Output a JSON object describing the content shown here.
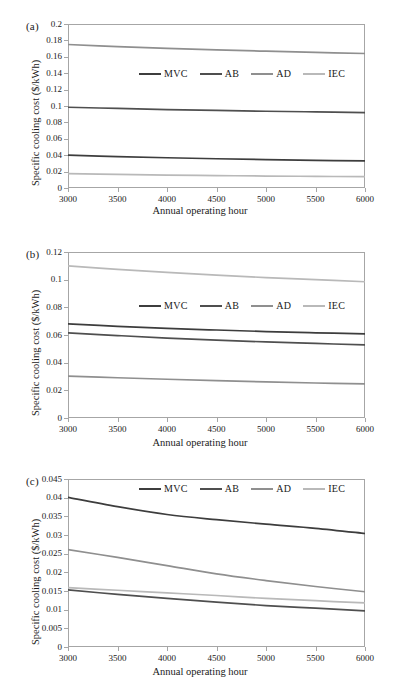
{
  "figure": {
    "panel_count": 3,
    "shared_xlabel": "Annual operating hour",
    "shared_ylabel": "Specific cooling cost ($/kWh)",
    "series_names": [
      "MVC",
      "AB",
      "AD",
      "IEC"
    ],
    "series_colors": [
      "#3d3d3d",
      "#4f4f4f",
      "#8f8f8f",
      "#b9b9b9"
    ]
  },
  "chart_data": [
    {
      "type": "line",
      "panel": "(a)",
      "title": "",
      "xlabel": "Annual operating hour",
      "ylabel": "Specific cooling cost ($/kWh)",
      "x": [
        3000,
        3500,
        4000,
        4500,
        5000,
        5500,
        6000
      ],
      "xlim": [
        3000,
        6000
      ],
      "ylim": [
        0,
        0.2
      ],
      "xticks": [
        "3000",
        "3500",
        "4000",
        "4500",
        "5000",
        "5500",
        "6000"
      ],
      "yticks": [
        "0",
        "0.02",
        "0.04",
        "0.06",
        "0.08",
        "0.1",
        "0.12",
        "0.14",
        "0.16",
        "0.18",
        "0.2"
      ],
      "grid": false,
      "legend_position": "upper-center",
      "series": [
        {
          "name": "MVC",
          "color": "#3d3d3d",
          "values": [
            0.04,
            0.0383,
            0.0369,
            0.0357,
            0.0347,
            0.0338,
            0.033
          ]
        },
        {
          "name": "AB",
          "color": "#4f4f4f",
          "values": [
            0.0985,
            0.097,
            0.0957,
            0.0946,
            0.0936,
            0.0928,
            0.092
          ]
        },
        {
          "name": "AD",
          "color": "#8f8f8f",
          "values": [
            0.175,
            0.1725,
            0.1703,
            0.1684,
            0.1668,
            0.1653,
            0.164
          ]
        },
        {
          "name": "IEC",
          "color": "#b9b9b9",
          "values": [
            0.0175,
            0.0166,
            0.0158,
            0.0152,
            0.0146,
            0.0142,
            0.0138
          ]
        }
      ]
    },
    {
      "type": "line",
      "panel": "(b)",
      "title": "",
      "xlabel": "Annual operating hour",
      "ylabel": "Specific cooling cost ($/kWh)",
      "x": [
        3000,
        3500,
        4000,
        4500,
        5000,
        5500,
        6000
      ],
      "xlim": [
        3000,
        6000
      ],
      "ylim": [
        0,
        0.12
      ],
      "xticks": [
        "3000",
        "3500",
        "4000",
        "4500",
        "5000",
        "5500",
        "6000"
      ],
      "yticks": [
        "0",
        "0.02",
        "0.04",
        "0.06",
        "0.08",
        "0.1",
        "0.12"
      ],
      "grid": false,
      "legend_position": "upper-center",
      "series": [
        {
          "name": "MVC",
          "color": "#3d3d3d",
          "values": [
            0.068,
            0.0663,
            0.0648,
            0.0636,
            0.0625,
            0.0616,
            0.0608
          ]
        },
        {
          "name": "AB",
          "color": "#4f4f4f",
          "values": [
            0.0615,
            0.0596,
            0.0578,
            0.0563,
            0.055,
            0.0539,
            0.0528
          ]
        },
        {
          "name": "AD",
          "color": "#8f8f8f",
          "values": [
            0.0303,
            0.0291,
            0.028,
            0.027,
            0.0261,
            0.0253,
            0.0246
          ]
        },
        {
          "name": "IEC",
          "color": "#b9b9b9",
          "values": [
            0.11,
            0.1075,
            0.1053,
            0.1033,
            0.1015,
            0.1,
            0.0985
          ]
        }
      ]
    },
    {
      "type": "line",
      "panel": "(c)",
      "title": "",
      "xlabel": "Annual operating hour",
      "ylabel": "Specific cooling cost ($/kWh)",
      "x": [
        3000,
        3500,
        4000,
        4500,
        5000,
        5500,
        6000
      ],
      "xlim": [
        3000,
        6000
      ],
      "ylim": [
        0,
        0.045
      ],
      "xticks": [
        "3000",
        "3500",
        "4000",
        "4500",
        "5000",
        "5500",
        "6000"
      ],
      "yticks": [
        "0",
        "0.005",
        "0.01",
        "0.015",
        "0.02",
        "0.025",
        "0.03",
        "0.035",
        "0.04",
        "0.045"
      ],
      "grid": false,
      "legend_position": "upper-center",
      "series": [
        {
          "name": "MVC",
          "color": "#3d3d3d",
          "values": [
            0.0401,
            0.0376,
            0.0355,
            0.0341,
            0.0329,
            0.0318,
            0.0304
          ]
        },
        {
          "name": "AB",
          "color": "#4f4f4f",
          "values": [
            0.0153,
            0.0141,
            0.013,
            0.012,
            0.0111,
            0.0104,
            0.0097
          ]
        },
        {
          "name": "AD",
          "color": "#8f8f8f",
          "values": [
            0.0261,
            0.024,
            0.0218,
            0.0196,
            0.0178,
            0.0162,
            0.0148
          ]
        },
        {
          "name": "IEC",
          "color": "#b9b9b9",
          "values": [
            0.0159,
            0.0152,
            0.0145,
            0.0138,
            0.013,
            0.0124,
            0.0118
          ]
        }
      ]
    }
  ]
}
